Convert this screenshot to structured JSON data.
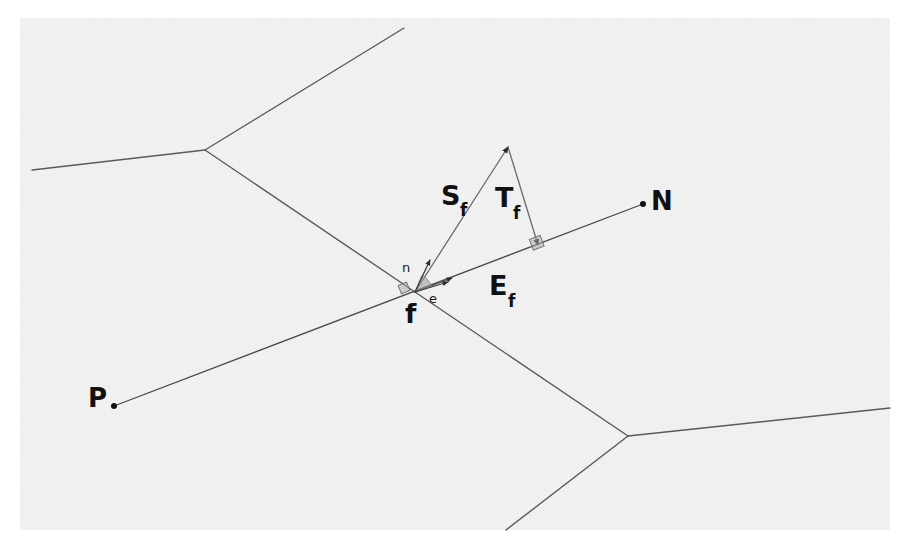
{
  "figure": {
    "kind": "geometry-diagram",
    "background_color": "#ffffff",
    "scan_tint_color": "#f4f4f4",
    "ink_color": "#111111",
    "line_color": "#5a5a5a",
    "marker_fill_color": "#9a9a9a",
    "width": 902,
    "height": 552
  },
  "labels": {
    "s_axis": {
      "base": "S",
      "sub": "f",
      "x": 455,
      "y": 201
    },
    "t_axis": {
      "base": "T",
      "sub": "f",
      "x": 508,
      "y": 212
    },
    "e_axis": {
      "base": "E",
      "sub": "f",
      "x": 502,
      "y": 292
    },
    "point_n": {
      "text": "N",
      "x": 655,
      "y": 208
    },
    "point_p": {
      "text": "P",
      "x": 89,
      "y": 404
    },
    "point_f": {
      "text": "f",
      "x": 409,
      "y": 322
    },
    "unit_n": {
      "text": "n",
      "x": 406,
      "y": 271
    },
    "unit_e": {
      "text": "e",
      "x": 432,
      "y": 302
    }
  },
  "points": {
    "f": {
      "x": 415,
      "y": 292,
      "name": "face-center-f"
    },
    "n_site": {
      "x": 643,
      "y": 204,
      "name": "site-N"
    },
    "p_site": {
      "x": 114,
      "y": 406,
      "name": "site-P"
    },
    "tri_apex": {
      "x": 508,
      "y": 147,
      "name": "triangle-apex"
    },
    "tri_foot": {
      "x": 538,
      "y": 245,
      "name": "triangle-foot"
    },
    "vertex_upper": {
      "x": 205,
      "y": 150,
      "name": "voronoi-vertex-upper-left"
    },
    "vertex_lower": {
      "x": 628,
      "y": 436,
      "name": "voronoi-vertex-lower-right"
    }
  },
  "voronoi_edges": [
    {
      "name": "edge-upper-left-to-left-border",
      "x1": 205,
      "y1": 150,
      "x2": 32,
      "y2": 170
    },
    {
      "name": "edge-upper-left-to-top-border",
      "x1": 205,
      "y1": 150,
      "x2": 404,
      "y2": 28
    },
    {
      "name": "edge-upper-left-to-f",
      "x1": 205,
      "y1": 150,
      "x2": 415,
      "y2": 292
    },
    {
      "name": "edge-f-to-lower-right-vertex",
      "x1": 415,
      "y1": 292,
      "x2": 628,
      "y2": 436
    },
    {
      "name": "edge-lower-right-to-right-border",
      "x1": 628,
      "y1": 436,
      "x2": 890,
      "y2": 408
    },
    {
      "name": "edge-lower-right-to-bottom-border",
      "x1": 628,
      "y1": 436,
      "x2": 506,
      "y2": 530
    }
  ],
  "frame_axes": [
    {
      "name": "axis-e-f-through-sites",
      "x1": 114,
      "y1": 406,
      "x2": 643,
      "y2": 204,
      "arrow_at": "both-sites"
    }
  ],
  "triangle": {
    "name": "frame-triangle",
    "edges": [
      {
        "name": "triangle-edge-S-f",
        "x1": 415,
        "y1": 292,
        "x2": 508,
        "y2": 147
      },
      {
        "name": "triangle-edge-T-f",
        "x1": 508,
        "y1": 147,
        "x2": 538,
        "y2": 245
      }
    ]
  },
  "markers": {
    "angle_sector": {
      "name": "angle-marker-at-f",
      "cx": 415,
      "cy": 292,
      "r": 17
    },
    "right_angle_small": {
      "name": "right-angle-marker-at-f",
      "cx": 404,
      "cy": 288,
      "size": 9
    },
    "right_angle_foot": {
      "name": "right-angle-marker-at-foot",
      "cx": 537,
      "cy": 243,
      "size": 11
    }
  },
  "unit_vectors": [
    {
      "name": "unit-vector-n",
      "x1": 415,
      "y1": 292,
      "x2": 429,
      "y2": 261
    },
    {
      "name": "unit-vector-e",
      "x1": 415,
      "y1": 292,
      "x2": 446,
      "y2": 283
    }
  ]
}
